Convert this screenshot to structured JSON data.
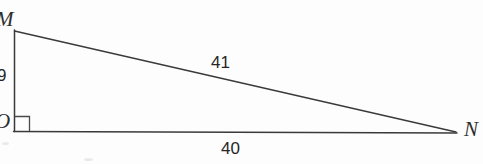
{
  "figure": {
    "shape": "right-triangle",
    "background_color": "#fdfdfd",
    "stroke_color": "#3a3a3a",
    "vertices": [
      {
        "name": "M",
        "label": "M",
        "x": 14,
        "y": 31,
        "position": "top-left"
      },
      {
        "name": "O",
        "label": "O",
        "x": 14,
        "y": 131,
        "position": "bottom-left"
      },
      {
        "name": "N",
        "label": "N",
        "x": 456,
        "y": 132,
        "position": "bottom-right"
      }
    ],
    "right_angle": {
      "at_vertex": "O",
      "marker": "square",
      "size": 15
    },
    "sides": [
      {
        "name": "leg-vertical",
        "from": "M",
        "to": "O",
        "length": "9",
        "label_position": "left"
      },
      {
        "name": "base",
        "from": "O",
        "to": "N",
        "length": "40",
        "label_position": "below"
      },
      {
        "name": "hypotenuse",
        "from": "M",
        "to": "N",
        "length": "41",
        "label_position": "above"
      }
    ]
  }
}
